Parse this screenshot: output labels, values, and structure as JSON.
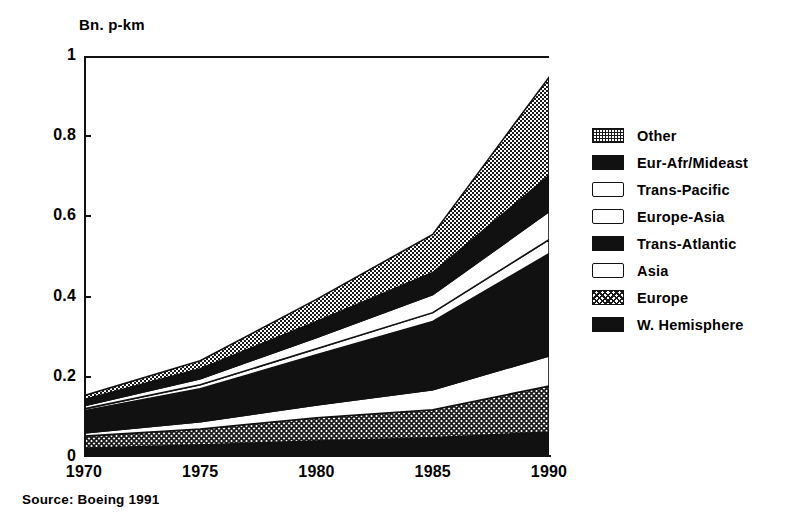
{
  "figure": {
    "ylabel": "Bn. p-km",
    "source": "Source: Boeing 1991"
  },
  "chart_data": {
    "type": "area",
    "title": "",
    "subtitle": "",
    "xlabel": "",
    "ylabel": "Bn. p-km",
    "x": [
      1970,
      1975,
      1980,
      1985,
      1990
    ],
    "xticklabels": [
      "1970",
      "1975",
      "1980",
      "1985",
      "1990"
    ],
    "yticklabels": [
      "0",
      "0.2",
      "0.4",
      "0.6",
      "0.8",
      "1"
    ],
    "ytickvalues": [
      0,
      0.2,
      0.4,
      0.6,
      0.8,
      1
    ],
    "xlim": [
      1970,
      1990
    ],
    "ylim": [
      0,
      1
    ],
    "grid": false,
    "stacked": true,
    "legend_position": "right",
    "series": [
      {
        "name": "W. Hemisphere",
        "fill": "solid-black",
        "values": [
          0.022,
          0.03,
          0.04,
          0.048,
          0.062
        ]
      },
      {
        "name": "Europe",
        "fill": "cross-hatch",
        "values": [
          0.03,
          0.04,
          0.058,
          0.07,
          0.115
        ]
      },
      {
        "name": "Asia",
        "fill": "white",
        "values": [
          0.008,
          0.018,
          0.032,
          0.05,
          0.075
        ]
      },
      {
        "name": "Trans-Atlantic",
        "fill": "solid-black",
        "values": [
          0.055,
          0.082,
          0.125,
          0.17,
          0.255
        ]
      },
      {
        "name": "Europe-Asia",
        "fill": "white",
        "values": [
          0.005,
          0.01,
          0.015,
          0.022,
          0.035
        ]
      },
      {
        "name": "Trans-Pacific",
        "fill": "white",
        "values": [
          0.008,
          0.015,
          0.028,
          0.045,
          0.07
        ]
      },
      {
        "name": "Eur-Afr/Mideast",
        "fill": "solid-black",
        "values": [
          0.015,
          0.025,
          0.04,
          0.055,
          0.09
        ]
      },
      {
        "name": "Other",
        "fill": "stipple-gray",
        "values": [
          0.01,
          0.02,
          0.055,
          0.095,
          0.245
        ]
      }
    ],
    "stack_tops": {
      "1970": [
        0.022,
        0.052,
        0.06,
        0.115,
        0.12,
        0.128,
        0.143,
        0.153
      ],
      "1975": [
        0.03,
        0.07,
        0.088,
        0.17,
        0.18,
        0.195,
        0.22,
        0.24
      ],
      "1980": [
        0.04,
        0.098,
        0.13,
        0.255,
        0.27,
        0.298,
        0.338,
        0.393
      ],
      "1985": [
        0.048,
        0.118,
        0.168,
        0.338,
        0.36,
        0.405,
        0.46,
        0.555
      ],
      "1990": [
        0.062,
        0.177,
        0.252,
        0.507,
        0.542,
        0.612,
        0.702,
        0.947
      ]
    }
  },
  "legend": {
    "items": [
      {
        "label": "Other"
      },
      {
        "label": "Eur-Afr/Mideast"
      },
      {
        "label": "Trans-Pacific"
      },
      {
        "label": "Europe-Asia"
      },
      {
        "label": "Trans-Atlantic"
      },
      {
        "label": "Asia"
      },
      {
        "label": "Europe"
      },
      {
        "label": "W. Hemisphere"
      }
    ]
  }
}
